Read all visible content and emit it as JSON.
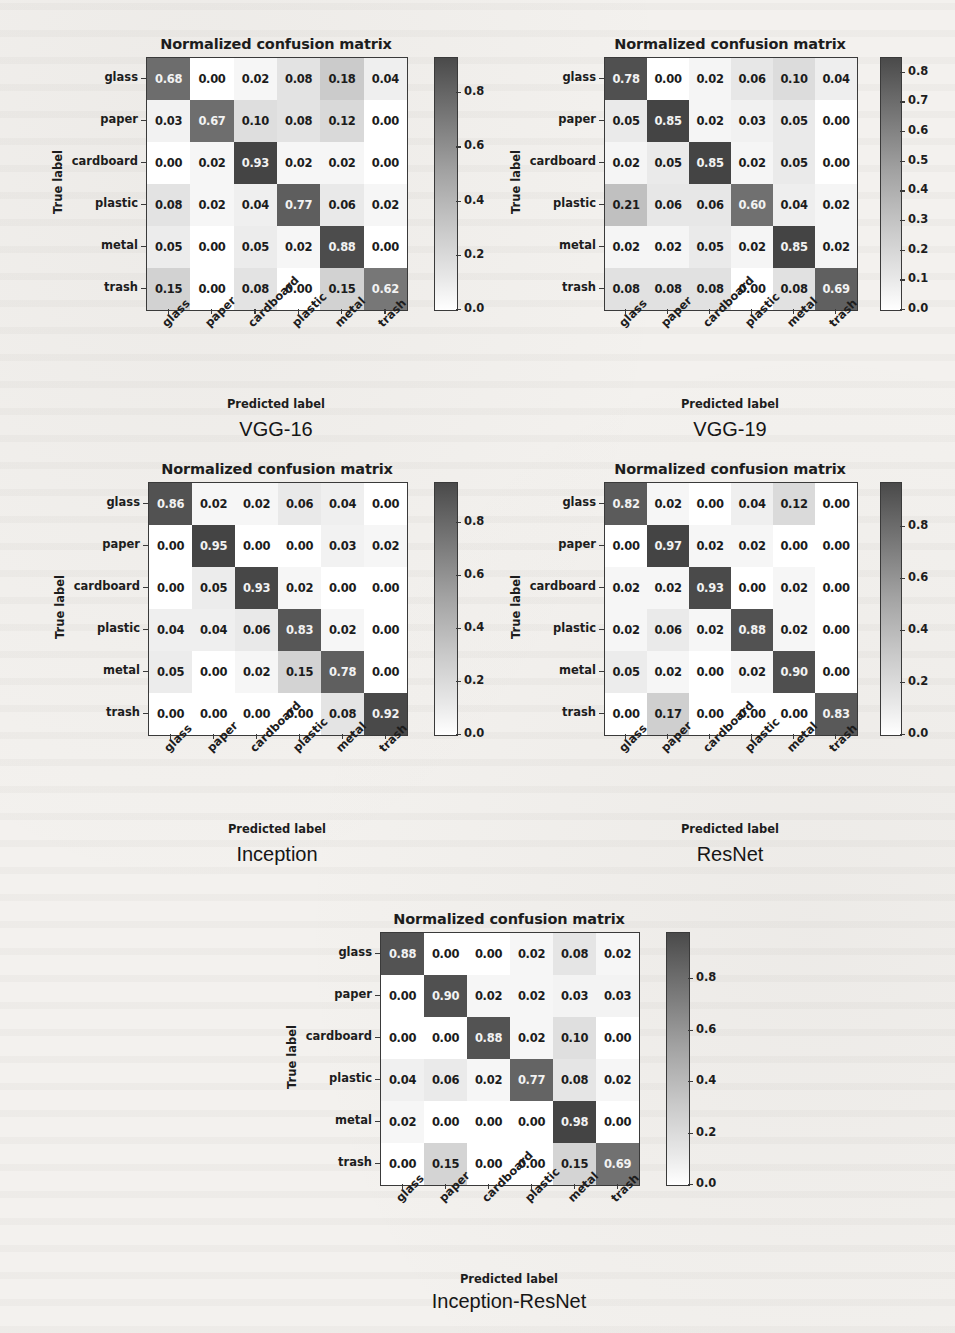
{
  "figure": {
    "classes": [
      "glass",
      "paper",
      "cardboard",
      "plastic",
      "metal",
      "trash"
    ],
    "chart_title": "Normalized confusion matrix",
    "xlabel": "Predicted label",
    "ylabel": "True label"
  },
  "chart_data": [
    {
      "type": "heatmap",
      "title": "Normalized confusion matrix",
      "model": "VGG-16",
      "xlabel": "Predicted label",
      "ylabel": "True label",
      "x_categories": [
        "glass",
        "paper",
        "cardboard",
        "plastic",
        "metal",
        "trash"
      ],
      "y_categories": [
        "glass",
        "paper",
        "cardboard",
        "plastic",
        "metal",
        "trash"
      ],
      "colorbar_ticks": [
        "0.0",
        "0.2",
        "0.4",
        "0.6",
        "0.8"
      ],
      "zlim": [
        0.0,
        0.93
      ],
      "values": [
        [
          "0.68",
          "0.00",
          "0.02",
          "0.08",
          "0.18",
          "0.04"
        ],
        [
          "0.03",
          "0.67",
          "0.10",
          "0.08",
          "0.12",
          "0.00"
        ],
        [
          "0.00",
          "0.02",
          "0.93",
          "0.02",
          "0.02",
          "0.00"
        ],
        [
          "0.08",
          "0.02",
          "0.04",
          "0.77",
          "0.06",
          "0.02"
        ],
        [
          "0.05",
          "0.00",
          "0.05",
          "0.02",
          "0.88",
          "0.00"
        ],
        [
          "0.15",
          "0.00",
          "0.08",
          "0.00",
          "0.15",
          "0.62"
        ]
      ]
    },
    {
      "type": "heatmap",
      "title": "Normalized confusion matrix",
      "model": "VGG-19",
      "xlabel": "Predicted label",
      "ylabel": "True label",
      "x_categories": [
        "glass",
        "paper",
        "cardboard",
        "plastic",
        "metal",
        "trash"
      ],
      "y_categories": [
        "glass",
        "paper",
        "cardboard",
        "plastic",
        "metal",
        "trash"
      ],
      "colorbar_ticks": [
        "0.0",
        "0.1",
        "0.2",
        "0.3",
        "0.4",
        "0.5",
        "0.6",
        "0.7",
        "0.8"
      ],
      "zlim": [
        0.0,
        0.85
      ],
      "values": [
        [
          "0.78",
          "0.00",
          "0.02",
          "0.06",
          "0.10",
          "0.04"
        ],
        [
          "0.05",
          "0.85",
          "0.02",
          "0.03",
          "0.05",
          "0.00"
        ],
        [
          "0.02",
          "0.05",
          "0.85",
          "0.02",
          "0.05",
          "0.00"
        ],
        [
          "0.21",
          "0.06",
          "0.06",
          "0.60",
          "0.04",
          "0.02"
        ],
        [
          "0.02",
          "0.02",
          "0.05",
          "0.02",
          "0.85",
          "0.02"
        ],
        [
          "0.08",
          "0.08",
          "0.08",
          "0.00",
          "0.08",
          "0.69"
        ]
      ]
    },
    {
      "type": "heatmap",
      "title": "Normalized confusion matrix",
      "model": "Inception",
      "xlabel": "Predicted label",
      "ylabel": "True label",
      "x_categories": [
        "glass",
        "paper",
        "cardboard",
        "plastic",
        "metal",
        "trash"
      ],
      "y_categories": [
        "glass",
        "paper",
        "cardboard",
        "plastic",
        "metal",
        "trash"
      ],
      "colorbar_ticks": [
        "0.0",
        "0.2",
        "0.4",
        "0.6",
        "0.8"
      ],
      "zlim": [
        0.0,
        0.95
      ],
      "values": [
        [
          "0.86",
          "0.02",
          "0.02",
          "0.06",
          "0.04",
          "0.00"
        ],
        [
          "0.00",
          "0.95",
          "0.00",
          "0.00",
          "0.03",
          "0.02"
        ],
        [
          "0.00",
          "0.05",
          "0.93",
          "0.02",
          "0.00",
          "0.00"
        ],
        [
          "0.04",
          "0.04",
          "0.06",
          "0.83",
          "0.02",
          "0.00"
        ],
        [
          "0.05",
          "0.00",
          "0.02",
          "0.15",
          "0.78",
          "0.00"
        ],
        [
          "0.00",
          "0.00",
          "0.00",
          "0.00",
          "0.08",
          "0.92"
        ]
      ]
    },
    {
      "type": "heatmap",
      "title": "Normalized confusion matrix",
      "model": "ResNet",
      "xlabel": "Predicted label",
      "ylabel": "True label",
      "x_categories": [
        "glass",
        "paper",
        "cardboard",
        "plastic",
        "metal",
        "trash"
      ],
      "y_categories": [
        "glass",
        "paper",
        "cardboard",
        "plastic",
        "metal",
        "trash"
      ],
      "colorbar_ticks": [
        "0.0",
        "0.2",
        "0.4",
        "0.6",
        "0.8"
      ],
      "zlim": [
        0.0,
        0.97
      ],
      "values": [
        [
          "0.82",
          "0.02",
          "0.00",
          "0.04",
          "0.12",
          "0.00"
        ],
        [
          "0.00",
          "0.97",
          "0.02",
          "0.02",
          "0.00",
          "0.00"
        ],
        [
          "0.02",
          "0.02",
          "0.93",
          "0.00",
          "0.02",
          "0.00"
        ],
        [
          "0.02",
          "0.06",
          "0.02",
          "0.88",
          "0.02",
          "0.00"
        ],
        [
          "0.05",
          "0.02",
          "0.00",
          "0.02",
          "0.90",
          "0.00"
        ],
        [
          "0.00",
          "0.17",
          "0.00",
          "0.00",
          "0.00",
          "0.83"
        ]
      ]
    },
    {
      "type": "heatmap",
      "title": "Normalized confusion matrix",
      "model": "Inception-ResNet",
      "xlabel": "Predicted label",
      "ylabel": "True label",
      "x_categories": [
        "glass",
        "paper",
        "cardboard",
        "plastic",
        "metal",
        "trash"
      ],
      "y_categories": [
        "glass",
        "paper",
        "cardboard",
        "plastic",
        "metal",
        "trash"
      ],
      "colorbar_ticks": [
        "0.0",
        "0.2",
        "0.4",
        "0.6",
        "0.8"
      ],
      "zlim": [
        0.0,
        0.98
      ],
      "values": [
        [
          "0.88",
          "0.00",
          "0.00",
          "0.02",
          "0.08",
          "0.02"
        ],
        [
          "0.00",
          "0.90",
          "0.02",
          "0.02",
          "0.03",
          "0.03"
        ],
        [
          "0.00",
          "0.00",
          "0.88",
          "0.02",
          "0.10",
          "0.00"
        ],
        [
          "0.04",
          "0.06",
          "0.02",
          "0.77",
          "0.08",
          "0.02"
        ],
        [
          "0.02",
          "0.00",
          "0.00",
          "0.00",
          "0.98",
          "0.00"
        ],
        [
          "0.00",
          "0.15",
          "0.00",
          "0.00",
          "0.15",
          "0.69"
        ]
      ]
    }
  ],
  "layout": [
    {
      "x": 146,
      "y": 57,
      "w": 260,
      "h": 252,
      "cbx": 434,
      "cbw": 22,
      "cbh": 252,
      "title_x": 146,
      "title_y": 36,
      "model_x": 146,
      "model_y": 418
    },
    {
      "x": 604,
      "y": 57,
      "w": 252,
      "h": 252,
      "cbx": 880,
      "cbw": 20,
      "cbh": 252,
      "title_x": 604,
      "title_y": 36,
      "model_x": 604,
      "model_y": 418
    },
    {
      "x": 148,
      "y": 482,
      "w": 258,
      "h": 252,
      "cbx": 434,
      "cbw": 22,
      "cbh": 252,
      "title_x": 148,
      "title_y": 461,
      "model_x": 148,
      "model_y": 843
    },
    {
      "x": 604,
      "y": 482,
      "w": 252,
      "h": 252,
      "cbx": 880,
      "cbw": 20,
      "cbh": 252,
      "title_x": 604,
      "title_y": 461,
      "model_x": 604,
      "model_y": 843
    },
    {
      "x": 380,
      "y": 932,
      "w": 258,
      "h": 252,
      "cbx": 666,
      "cbw": 22,
      "cbh": 252,
      "title_x": 380,
      "title_y": 911,
      "model_x": 380,
      "model_y": 1290
    }
  ]
}
